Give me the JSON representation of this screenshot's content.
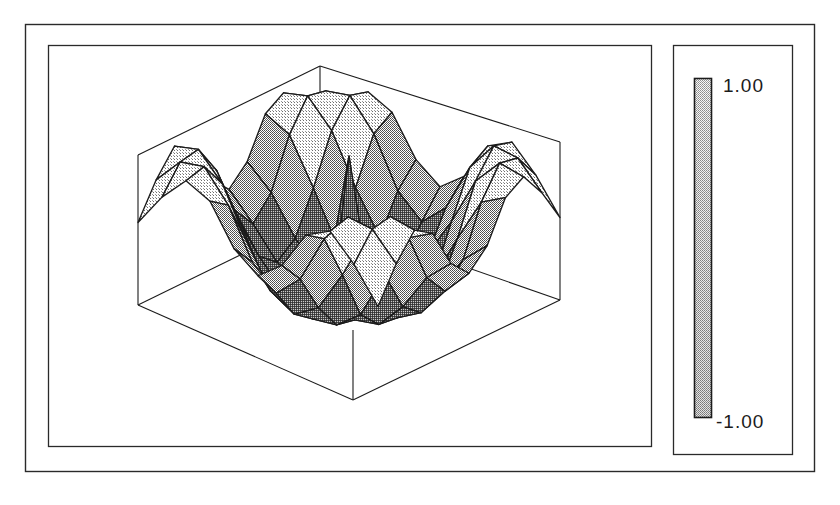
{
  "figure": {
    "title": "",
    "background_color": "#ffffff",
    "line_color": "#1b1b1b",
    "outer_frame": {
      "x": 25,
      "y": 24,
      "width": 790,
      "height": 448
    },
    "plot_panel": {
      "x": 48,
      "y": 45,
      "width": 604,
      "height": 402
    },
    "legend_panel": {
      "x": 673,
      "y": 45,
      "width": 120,
      "height": 410
    }
  },
  "colorbar": {
    "label_max": "1.00",
    "label_min": "-1.00",
    "orientation": "vertical",
    "bar": {
      "x": 694,
      "y": 78,
      "width": 18,
      "height": 340
    },
    "fill_top_color": "#d8d8d8",
    "fill_bottom_color": "#8f8f8f",
    "border_color": "#1b1b1b"
  },
  "chart_data": {
    "type": "surface",
    "title": "",
    "xlabel": "",
    "ylabel": "",
    "zlabel": "",
    "grid": true,
    "legend_position": "right",
    "colorbar_range": [
      -1.0,
      1.0
    ],
    "zlim": [
      -1.0,
      1.0
    ],
    "xlim": [
      -1.0,
      1.0
    ],
    "ylim": [
      -1.0,
      1.0
    ],
    "nx": 11,
    "ny": 11,
    "x": [
      -1.0,
      -0.8,
      -0.6,
      -0.4,
      -0.2,
      0.0,
      0.2,
      0.4,
      0.6,
      0.8,
      1.0
    ],
    "y": [
      -1.0,
      -0.8,
      -0.6,
      -0.4,
      -0.2,
      0.0,
      0.2,
      0.4,
      0.6,
      0.8,
      1.0
    ],
    "z": [
      [
        0.1,
        0.55,
        0.88,
        0.72,
        0.2,
        -0.05,
        0.2,
        0.72,
        0.88,
        0.55,
        0.1
      ],
      [
        0.55,
        0.9,
        0.95,
        0.55,
        -0.1,
        -0.4,
        -0.1,
        0.55,
        0.95,
        0.9,
        0.55
      ],
      [
        0.88,
        0.95,
        0.6,
        -0.05,
        -0.6,
        -0.8,
        -0.6,
        -0.05,
        0.6,
        0.95,
        0.88
      ],
      [
        0.72,
        0.55,
        -0.05,
        -0.7,
        -0.95,
        -0.98,
        -0.95,
        -0.7,
        -0.05,
        0.55,
        0.72
      ],
      [
        0.2,
        -0.1,
        -0.6,
        -0.95,
        -1.0,
        -0.95,
        -1.0,
        -0.95,
        -0.6,
        -0.1,
        0.2
      ],
      [
        -0.05,
        -0.4,
        -0.8,
        -0.98,
        -0.95,
        0.95,
        -0.95,
        -0.98,
        -0.8,
        -0.4,
        -0.05
      ],
      [
        0.2,
        -0.1,
        -0.6,
        -0.95,
        -1.0,
        -0.95,
        -1.0,
        -0.95,
        -0.6,
        -0.1,
        0.2
      ],
      [
        0.72,
        0.55,
        -0.05,
        -0.7,
        -0.95,
        -0.98,
        -0.95,
        -0.7,
        -0.05,
        0.55,
        0.72
      ],
      [
        0.88,
        0.95,
        0.6,
        -0.05,
        -0.6,
        -0.8,
        -0.6,
        -0.05,
        0.6,
        0.95,
        0.88
      ],
      [
        0.55,
        0.9,
        0.95,
        0.55,
        -0.1,
        -0.4,
        -0.1,
        0.55,
        0.95,
        0.9,
        0.55
      ],
      [
        0.1,
        0.55,
        0.88,
        0.72,
        0.2,
        -0.05,
        0.2,
        0.72,
        0.88,
        0.55,
        0.1
      ]
    ],
    "box": {
      "top_vertex": {
        "x": 320,
        "y": 66
      },
      "left_vertex": {
        "x": 138,
        "y": 155
      },
      "right_vertex": {
        "x": 560,
        "y": 142
      },
      "back_vertex": {
        "x": 346,
        "y": 228
      },
      "front_vertex": {
        "x": 353,
        "y": 400
      },
      "left_bottom": {
        "x": 138,
        "y": 305
      },
      "right_bottom": {
        "x": 560,
        "y": 300
      }
    }
  }
}
